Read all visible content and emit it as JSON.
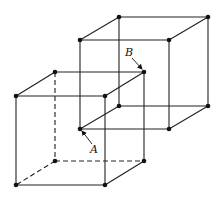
{
  "diagram": {
    "colors": {
      "line": "#222222",
      "dot": "#111111",
      "background": "#ffffff"
    },
    "back_cube": {
      "vertices": [
        [
          119,
          17
        ],
        [
          208,
          17
        ],
        [
          80,
          40
        ],
        [
          169,
          40
        ],
        [
          119,
          106
        ],
        [
          208,
          106
        ],
        [
          80,
          129
        ],
        [
          169,
          129
        ]
      ],
      "edges": [
        [
          0,
          1
        ],
        [
          0,
          2
        ],
        [
          1,
          3
        ],
        [
          2,
          3
        ],
        [
          4,
          5
        ],
        [
          4,
          6
        ],
        [
          5,
          7
        ],
        [
          6,
          7
        ],
        [
          0,
          4
        ],
        [
          1,
          5
        ],
        [
          2,
          6
        ],
        [
          3,
          7
        ]
      ]
    },
    "front_cube": {
      "vertices": [
        [
          55,
          72
        ],
        [
          144,
          72
        ],
        [
          16,
          96
        ],
        [
          105,
          96
        ],
        [
          55,
          161
        ],
        [
          144,
          161
        ],
        [
          16,
          185
        ],
        [
          105,
          185
        ]
      ],
      "edges": [
        [
          0,
          1
        ],
        [
          0,
          2
        ],
        [
          1,
          3
        ],
        [
          2,
          3
        ],
        [
          4,
          5
        ],
        [
          4,
          6
        ],
        [
          5,
          7
        ],
        [
          6,
          7
        ],
        [
          0,
          4
        ],
        [
          1,
          5
        ],
        [
          2,
          6
        ],
        [
          3,
          7
        ]
      ],
      "dashed_edges": [
        [
          0,
          4
        ],
        [
          4,
          5
        ],
        [
          4,
          6
        ]
      ]
    },
    "labels": [
      {
        "text": "B",
        "x": 125,
        "y": 56,
        "arrow_from": [
          132,
          58
        ],
        "arrow_to": [
          142,
          69
        ]
      },
      {
        "text": "A",
        "x": 90,
        "y": 153,
        "arrow_from": [
          92,
          144
        ],
        "arrow_to": [
          82,
          131
        ]
      }
    ]
  }
}
